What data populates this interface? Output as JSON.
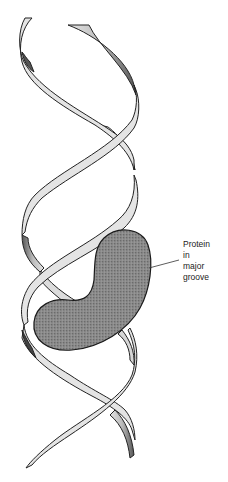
{
  "figure": {
    "label": {
      "lines": [
        "Protein",
        "in",
        "major",
        "groove"
      ]
    },
    "colors": {
      "ribbon_fill": "#e4e4e4",
      "ribbon_outline": "#222222",
      "protein_fill": "#8a8a8a",
      "protein_outline": "#1a1a1a",
      "leader_line": "#333333"
    }
  }
}
